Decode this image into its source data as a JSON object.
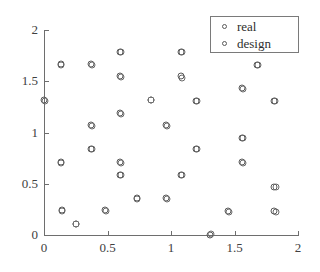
{
  "chart_data": {
    "type": "scatter",
    "title": "",
    "xlabel": "",
    "ylabel": "",
    "xlim": [
      0,
      2
    ],
    "ylim": [
      0,
      2
    ],
    "xticks": [
      "0",
      "0.5",
      "1",
      "1.5",
      "2"
    ],
    "xtick_values": [
      0,
      0.5,
      1,
      1.5,
      2
    ],
    "yticks": [
      "0",
      "0.5",
      "1",
      "1.5",
      "2"
    ],
    "ytick_values": [
      0,
      0.5,
      1,
      1.5,
      2
    ],
    "grid": false,
    "legend_position": "upper right",
    "marker_colors": {
      "real": "#5a5a5a",
      "design": "#6a6a6a",
      "axis": "#6e6e6e",
      "text": "#404040"
    },
    "series": [
      {
        "name": "real",
        "marker": "circle-open",
        "points": [
          [
            0.0,
            1.32
          ],
          [
            0.13,
            1.67
          ],
          [
            0.13,
            0.71
          ],
          [
            0.14,
            0.24
          ],
          [
            0.25,
            0.11
          ],
          [
            0.37,
            1.67
          ],
          [
            0.37,
            1.07
          ],
          [
            0.37,
            0.84
          ],
          [
            0.48,
            0.24
          ],
          [
            0.6,
            1.79
          ],
          [
            0.6,
            1.55
          ],
          [
            0.6,
            1.19
          ],
          [
            0.6,
            0.71
          ],
          [
            0.6,
            0.59
          ],
          [
            0.73,
            0.36
          ],
          [
            0.84,
            1.32
          ],
          [
            0.96,
            1.07
          ],
          [
            0.96,
            0.36
          ],
          [
            1.08,
            1.79
          ],
          [
            1.08,
            1.55
          ],
          [
            1.08,
            0.59
          ],
          [
            1.2,
            1.31
          ],
          [
            1.2,
            0.84
          ],
          [
            1.31,
            0.0
          ],
          [
            1.45,
            0.23
          ],
          [
            1.56,
            1.43
          ],
          [
            1.56,
            0.95
          ],
          [
            1.56,
            0.71
          ],
          [
            1.68,
            1.66
          ],
          [
            1.81,
            1.31
          ],
          [
            1.81,
            0.47
          ],
          [
            1.81,
            0.23
          ]
        ]
      },
      {
        "name": "design",
        "marker": "circle-open",
        "points": [
          [
            0.005,
            1.31
          ],
          [
            0.135,
            1.655
          ],
          [
            0.135,
            0.705
          ],
          [
            0.145,
            0.235
          ],
          [
            0.255,
            0.105
          ],
          [
            0.375,
            1.655
          ],
          [
            0.375,
            1.065
          ],
          [
            0.375,
            0.835
          ],
          [
            0.485,
            0.235
          ],
          [
            0.605,
            1.785
          ],
          [
            0.605,
            1.545
          ],
          [
            0.605,
            1.185
          ],
          [
            0.605,
            0.705
          ],
          [
            0.605,
            0.585
          ],
          [
            0.735,
            0.355
          ],
          [
            0.845,
            1.315
          ],
          [
            0.965,
            1.065
          ],
          [
            0.965,
            0.355
          ],
          [
            1.085,
            1.785
          ],
          [
            1.085,
            1.535
          ],
          [
            1.085,
            0.585
          ],
          [
            1.205,
            1.305
          ],
          [
            1.205,
            0.835
          ],
          [
            1.315,
            0.005
          ],
          [
            1.455,
            0.225
          ],
          [
            1.565,
            1.425
          ],
          [
            1.565,
            0.945
          ],
          [
            1.565,
            0.705
          ],
          [
            1.685,
            1.655
          ],
          [
            1.815,
            1.305
          ],
          [
            1.825,
            0.465
          ],
          [
            1.825,
            0.225
          ]
        ]
      }
    ]
  },
  "legend": {
    "entries": [
      {
        "label": "real"
      },
      {
        "label": "design"
      }
    ]
  }
}
